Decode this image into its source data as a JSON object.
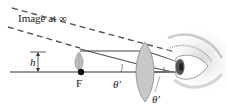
{
  "diagram": {
    "type": "optics-simple-magnifier",
    "labels": {
      "image_at_infinity": "Image at ∞",
      "height": "h",
      "focal_point": "F",
      "angle_left": "θ′",
      "angle_right": "θ′"
    },
    "elements": [
      {
        "name": "optical-axis"
      },
      {
        "name": "object-leaf"
      },
      {
        "name": "focal-point"
      },
      {
        "name": "converging-lens"
      },
      {
        "name": "eye"
      },
      {
        "name": "parallel-ray"
      },
      {
        "name": "chief-ray"
      },
      {
        "name": "virtual-image-dashed-lines"
      }
    ],
    "colors": {
      "line": "#333333",
      "lens_fill": "#c8c8c8",
      "dashed": "#555555",
      "eye_shade": "#9a9a9a"
    }
  }
}
